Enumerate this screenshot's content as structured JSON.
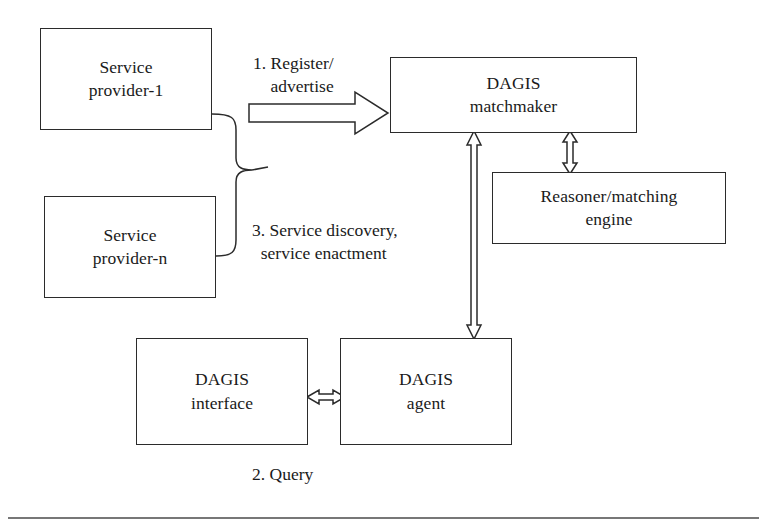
{
  "figure": {
    "background": "#ffffff",
    "stroke_color": "#2b2b2b",
    "width": 767,
    "height": 527
  },
  "nodes": {
    "provider_1": {
      "line1": "Service",
      "line2": "provider-1"
    },
    "provider_n": {
      "line1": "Service",
      "line2": "provider-n"
    },
    "matchmaker": {
      "line1": "DAGIS",
      "line2": "matchmaker"
    },
    "reasoner": {
      "line1": "Reasoner/matching",
      "line2": "engine"
    },
    "interface": {
      "line1": "DAGIS",
      "line2": "interface"
    },
    "agent": {
      "line1": "DAGIS",
      "line2": "agent"
    }
  },
  "labels": {
    "register": "1. Register/\n    advertise",
    "discovery": "3. Service discovery,\n  service enactment",
    "query": "2. Query"
  },
  "connectors": [
    {
      "name": "providers-brace",
      "kind": "curly-brace",
      "note": "joins service provider-1 and service provider-n"
    },
    {
      "name": "register-arrow",
      "kind": "block-arrow-right",
      "from": "service providers",
      "to": "DAGIS matchmaker"
    },
    {
      "name": "matchmaker-reasoner-arrow",
      "kind": "block-arrow-bidirectional-vertical",
      "from": "DAGIS matchmaker",
      "to": "Reasoner/matching engine"
    },
    {
      "name": "matchmaker-agent-arrow",
      "kind": "block-arrow-bidirectional-vertical",
      "from": "DAGIS matchmaker",
      "to": "DAGIS agent"
    },
    {
      "name": "interface-agent-arrow",
      "kind": "block-arrow-bidirectional-horizontal",
      "from": "DAGIS interface",
      "to": "DAGIS agent"
    }
  ],
  "footer_rule": {
    "name": "page-rule",
    "visible": true
  }
}
